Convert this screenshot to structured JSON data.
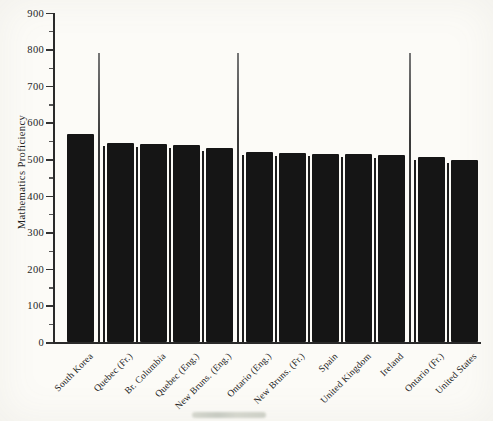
{
  "chart_data": {
    "type": "bar",
    "title": "",
    "ylabel": "Mathematics Proficiency",
    "xlabel": "",
    "ylim": [
      0,
      900
    ],
    "y_major_ticks": [
      0,
      100,
      200,
      300,
      400,
      500,
      600,
      700,
      800,
      900
    ],
    "y_minor_tick_step": 50,
    "grid": false,
    "legend": "none",
    "bar_color": "#151515",
    "categories": [
      "South Korea",
      "Quebec (Fr.)",
      "Br. Columbia",
      "Quebec (Eng.)",
      "New Bruns. (Eng.)",
      "Ontario (Eng.)",
      "New Bruns. (Fr.)",
      "Spain",
      "United Kingdom",
      "Ireland",
      "Ontario (Fr.)",
      "United States"
    ],
    "values": [
      567,
      543,
      542,
      537,
      531,
      519,
      517,
      515,
      513,
      512,
      506,
      498
    ],
    "group_separators_after_index": [
      0,
      4,
      9
    ],
    "separator_top_value": 790,
    "bar_divider_lines": true
  },
  "scan_artifact_color": "#c9ccc1"
}
